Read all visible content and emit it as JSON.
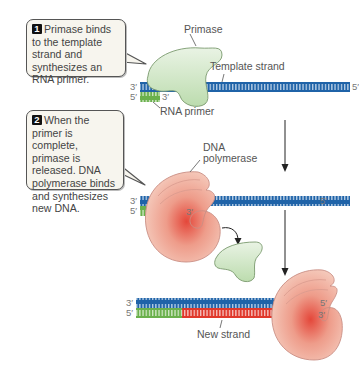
{
  "steps": [
    {
      "number": "1",
      "text": "Primase binds to the template strand and synthesizes an RNA primer."
    },
    {
      "number": "2",
      "text": "When the primer is complete, primase is released. DNA polymerase binds and synthesizes new DNA."
    }
  ],
  "labels": {
    "primase": "Primase",
    "template_strand": "Template strand",
    "rna_primer": "RNA primer",
    "dna_polymerase_line1": "DNA",
    "dna_polymerase_line2": "polymerase",
    "new_strand": "New strand"
  },
  "strand_ends": {
    "three_prime": "3′",
    "five_prime": "5′"
  },
  "colors": {
    "template_strand": "#1f63a8",
    "rna_primer": "#6ab04c",
    "new_strand": "#e0382b",
    "primase": "#dcebd5",
    "polymerase": "#f2bfb0",
    "callout_bg": "#f7f5ee"
  }
}
